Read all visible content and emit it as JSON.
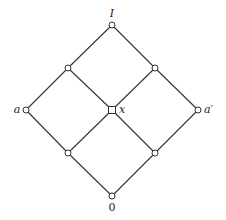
{
  "diagram": {
    "type": "hasse-diagram",
    "nodes": [
      {
        "id": "I",
        "label": "I",
        "x": 112,
        "y": 25
      },
      {
        "id": "ul",
        "label": "",
        "x": 68,
        "y": 68
      },
      {
        "id": "ur",
        "label": "",
        "x": 155,
        "y": 68
      },
      {
        "id": "a",
        "label": "a",
        "x": 26,
        "y": 110
      },
      {
        "id": "x",
        "label": "x",
        "x": 112,
        "y": 110
      },
      {
        "id": "a_prime",
        "label": "a′",
        "x": 198,
        "y": 110
      },
      {
        "id": "ll",
        "label": "",
        "x": 68,
        "y": 153
      },
      {
        "id": "lr",
        "label": "",
        "x": 155,
        "y": 153
      },
      {
        "id": "zero",
        "label": "0",
        "x": 112,
        "y": 196
      }
    ],
    "edges": [
      [
        "I",
        "ul"
      ],
      [
        "I",
        "ur"
      ],
      [
        "ul",
        "a"
      ],
      [
        "ul",
        "x"
      ],
      [
        "ur",
        "x"
      ],
      [
        "ur",
        "a_prime"
      ],
      [
        "a",
        "ll"
      ],
      [
        "x",
        "ll"
      ],
      [
        "x",
        "lr"
      ],
      [
        "a_prime",
        "lr"
      ],
      [
        "ll",
        "zero"
      ],
      [
        "lr",
        "zero"
      ]
    ],
    "labels": {
      "top": "I",
      "left": "a",
      "center": "x",
      "right": "a′",
      "bottom": "0"
    }
  }
}
